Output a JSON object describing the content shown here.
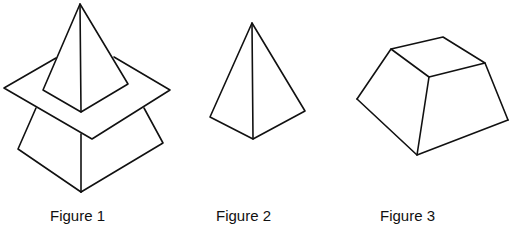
{
  "figures": [
    {
      "id": 1,
      "caption": "Figure 1",
      "description": "pyramid intersecting a plane, above a frustum"
    },
    {
      "id": 2,
      "caption": "Figure 2",
      "description": "pyramid"
    },
    {
      "id": 3,
      "caption": "Figure 3",
      "description": "frustum (truncated pyramid)"
    }
  ],
  "style": {
    "stroke": "#111111",
    "background": "#ffffff"
  }
}
